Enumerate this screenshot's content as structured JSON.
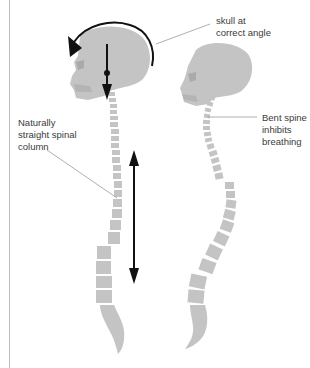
{
  "figure": {
    "colors": {
      "bone": "#c4c4c4",
      "arrow": "#111111",
      "leader_line": "#9a9a9a",
      "text": "#3a3a3a",
      "border": "#bdbdbd"
    },
    "left_figure": {
      "name": "correct posture",
      "label": {
        "lines": [
          "Naturally",
          "straight spinal",
          "column"
        ]
      }
    },
    "right_figure": {
      "name": "incorrect posture",
      "label": {
        "lines": [
          "Bent spine",
          "inhibits",
          "breathing"
        ]
      }
    },
    "top_label": {
      "lines": [
        "skull at",
        "correct angle"
      ]
    },
    "icons": [
      "rotation-arrow-icon",
      "down-arrow-icon",
      "double-headed-arrow-icon"
    ]
  }
}
